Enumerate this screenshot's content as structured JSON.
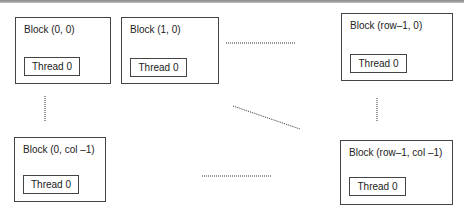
{
  "diagram": {
    "blocks": [
      {
        "label": "Block (0, 0)",
        "thread": "Thread 0"
      },
      {
        "label": "Block (1, 0)",
        "thread": "Thread 0"
      },
      {
        "label": "Block (row–1, 0)",
        "thread": "Thread 0"
      },
      {
        "label": "Block (0, col –1)",
        "thread": "Thread 0"
      },
      {
        "label": "Block (row–1, col –1)",
        "thread": "Thread 0"
      }
    ],
    "connectors": [
      {
        "from": "Block (1, 0)",
        "to": "Block (row-1, 0)",
        "style": "dotted-horizontal"
      },
      {
        "from": "Block (0, 0)",
        "to": "Block (0, col -1)",
        "style": "dotted-vertical"
      },
      {
        "from": "Block (row-1, 0)",
        "to": "Block (row-1, col -1)",
        "style": "dotted-vertical"
      },
      {
        "from": "center",
        "to": "Block (row-1, col -1)",
        "style": "dotted-diagonal"
      },
      {
        "from": "Block (0, col -1)",
        "to": "Block (row-1, col -1)",
        "style": "dotted-horizontal"
      }
    ]
  }
}
